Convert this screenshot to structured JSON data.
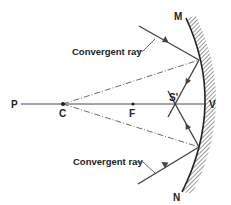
{
  "diagram": {
    "points": {
      "P": "P",
      "C": "C",
      "F": "F",
      "S": "S'",
      "V": "V",
      "M": "M",
      "N": "N"
    },
    "labels": {
      "upper_ray": "Convergent ray",
      "lower_ray": "Convergent ray"
    },
    "colors": {
      "line": "#333333",
      "ray": "#444444",
      "hatch": "#555555"
    }
  }
}
